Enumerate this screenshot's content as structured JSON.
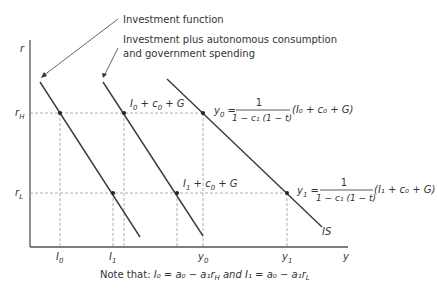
{
  "annotations": {
    "investment_function": "Investment function",
    "investment_plus_line1": "Investment plus autonomous consumption",
    "investment_plus_line2": "and government spending"
  },
  "axes": {
    "y_label": "r",
    "x_label": "y",
    "r_high": "r",
    "r_high_sub": "H",
    "r_low": "r",
    "r_low_sub": "L"
  },
  "x_ticks": {
    "I0": "I",
    "I0_sub": "0",
    "I1": "I",
    "I1_sub": "1",
    "y0": "y",
    "y0_sub": "0",
    "y1": "y",
    "y1_sub": "1"
  },
  "curve_labels": {
    "high": {
      "a": "I",
      "a_sub": "0",
      "rest": " + c",
      "c_sub": "0",
      "end": " + G"
    },
    "low": {
      "a": "I",
      "a_sub": "1",
      "rest": " + c",
      "c_sub": "0",
      "end": " + G"
    },
    "is": "IS"
  },
  "equations": {
    "y0": {
      "lhs": "y",
      "lhs_sub": "0",
      "numerator": "1",
      "denominator": "1 − c₁ (1 − t)",
      "rhs": "(I₀ + c₀ + G)"
    },
    "y1": {
      "lhs": "y",
      "lhs_sub": "1",
      "numerator": "1",
      "denominator": "1 − c₁ (1 − t)",
      "rhs": "(I₁ + c₀ + G)"
    }
  },
  "note": "Note that: I₀ = a₀ − a₁r",
  "note_parts": {
    "prefix": "Note that: ",
    "eq1": "I₀ = a₀ − a₁r",
    "eq1_sub": "H",
    "and": " and ",
    "eq2": "I₁ = a₀ − a₁r",
    "eq2_sub": "L"
  },
  "colors": {
    "line": "#3a3a3a",
    "dash": "#9a9a9a",
    "text": "#333333"
  }
}
